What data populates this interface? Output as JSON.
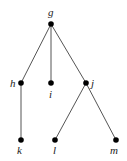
{
  "diagram": {
    "type": "tree",
    "nodes": [
      {
        "id": "g",
        "label": "g",
        "x": 51,
        "y": 24
      },
      {
        "id": "h",
        "label": "h",
        "x": 21,
        "y": 83
      },
      {
        "id": "i",
        "label": "i",
        "x": 51,
        "y": 83
      },
      {
        "id": "j",
        "label": "j",
        "x": 86,
        "y": 83
      },
      {
        "id": "k",
        "label": "k",
        "x": 21,
        "y": 140
      },
      {
        "id": "l",
        "label": "l",
        "x": 55,
        "y": 140
      },
      {
        "id": "m",
        "label": "m",
        "x": 116,
        "y": 140
      }
    ],
    "edges": [
      [
        "g",
        "h"
      ],
      [
        "g",
        "i"
      ],
      [
        "g",
        "j"
      ],
      [
        "h",
        "k"
      ],
      [
        "j",
        "l"
      ],
      [
        "j",
        "m"
      ]
    ],
    "colors": {
      "edge": "#555555",
      "node": "#000000"
    }
  }
}
